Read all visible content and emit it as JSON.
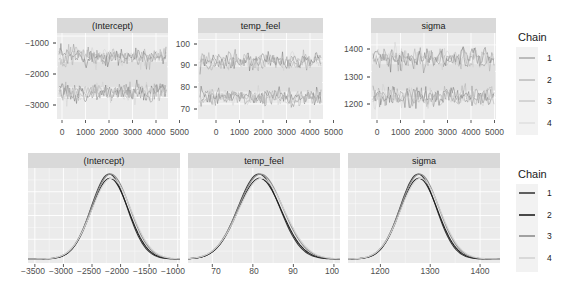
{
  "chart_data": [
    {
      "type": "line",
      "title": "Trace plots",
      "panels": [
        {
          "label": "(Intercept)",
          "xticks": [
            0,
            1000,
            2000,
            3000,
            4000,
            5000
          ],
          "xlim": [
            0,
            5000
          ],
          "yticks": [
            -1000,
            -2000,
            -3000
          ],
          "ylim": [
            -3700,
            -900
          ],
          "bands": [
            {
              "center": -1650,
              "spread": 300
            },
            {
              "center": -2850,
              "spread": 300
            }
          ]
        },
        {
          "label": "temp_feel",
          "xticks": [
            0,
            1000,
            2000,
            3000,
            4000,
            5000
          ],
          "xlim": [
            0,
            5000
          ],
          "yticks": [
            100,
            90,
            80,
            70
          ],
          "ylim": [
            63,
            103
          ],
          "bands": [
            {
              "center": 90,
              "spread": 4
            },
            {
              "center": 73,
              "spread": 4
            }
          ]
        },
        {
          "label": "sigma",
          "xticks": [
            0,
            1000,
            2000,
            3000,
            4000,
            5000
          ],
          "xlim": [
            0,
            5000
          ],
          "yticks": [
            1400,
            1300,
            1200
          ],
          "ylim": [
            1120,
            1445
          ],
          "bands": [
            {
              "center": 1350,
              "spread": 40
            },
            {
              "center": 1205,
              "spread": 40
            }
          ]
        }
      ],
      "legend": {
        "title": "Chain",
        "entries": [
          "1",
          "2",
          "3",
          "4"
        ],
        "position": "right"
      }
    },
    {
      "type": "area",
      "title": "Posterior density plots",
      "panels": [
        {
          "label": "(Intercept)",
          "xticks": [
            -3500,
            -3000,
            -2500,
            -2000,
            -1500,
            -1000
          ],
          "xlim": [
            -3620,
            -960
          ],
          "mean": -2180,
          "sd": 330
        },
        {
          "label": "temp_feel",
          "xticks": [
            70,
            80,
            90,
            100
          ],
          "xlim": [
            64,
            101.5
          ],
          "mean": 81.8,
          "sd": 5.4
        },
        {
          "label": "sigma",
          "xticks": [
            1200,
            1300,
            1400
          ],
          "xlim": [
            1135,
            1440
          ],
          "mean": 1278,
          "sd": 38
        }
      ],
      "legend": {
        "title": "Chain",
        "entries": [
          "1",
          "2",
          "3",
          "4"
        ],
        "position": "right"
      }
    }
  ],
  "trace": {
    "panels": [
      {
        "label": "(Intercept)",
        "yticks": [
          "−1000",
          "−2000",
          "−3000"
        ],
        "xticks": [
          "0",
          "1000",
          "2000",
          "3000",
          "4000",
          "5000"
        ]
      },
      {
        "label": "temp_feel",
        "yticks": [
          "100",
          "90",
          "80",
          "70"
        ],
        "xticks": [
          "0",
          "1000",
          "2000",
          "3000",
          "4000",
          "5000"
        ]
      },
      {
        "label": "sigma",
        "yticks": [
          "1400",
          "1300",
          "1200"
        ],
        "xticks": [
          "0",
          "1000",
          "2000",
          "3000",
          "4000",
          "5000"
        ]
      }
    ],
    "legend": {
      "title": "Chain",
      "entries": [
        "1",
        "2",
        "3",
        "4"
      ]
    }
  },
  "density": {
    "panels": [
      {
        "label": "(Intercept)",
        "xticks": [
          "−3500",
          "−3000",
          "−2500",
          "−2000",
          "−1500",
          "−1000"
        ]
      },
      {
        "label": "temp_feel",
        "xticks": [
          "70",
          "80",
          "90",
          "100"
        ]
      },
      {
        "label": "sigma",
        "xticks": [
          "1200",
          "1300",
          "1400"
        ]
      }
    ],
    "legend": {
      "title": "Chain",
      "entries": [
        "1",
        "2",
        "3",
        "4"
      ]
    }
  },
  "colors": {
    "panel_bg": "#ebebeb",
    "strip_bg": "#d9d9d9",
    "grid": "#ffffff",
    "chain_trace": [
      "#6a6a6a",
      "#8a8a8a",
      "#a8a8a8",
      "#cfcfcf"
    ],
    "chain_density": [
      "#3a3a3a",
      "#1f1f1f",
      "#8c8c8c",
      "#d2d2d2"
    ]
  }
}
